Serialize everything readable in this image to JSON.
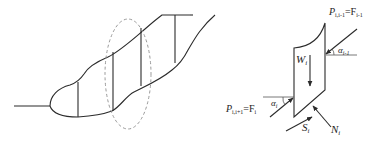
{
  "figure": {
    "left_panel": {
      "description": "Slope cross-section divided into vertical slices, one slice highlighted by dashed ellipse"
    },
    "right_panel": {
      "description": "Free-body diagram of slice i",
      "labels": {
        "P_left": {
          "base": "P",
          "sub": "i,i+1",
          "eq": "=F",
          "eq_sub": "i"
        },
        "P_right": {
          "base": "P",
          "sub": "i,i-1",
          "eq": "=F",
          "eq_sub": "i-1"
        },
        "weight": {
          "base": "W",
          "sub": "i"
        },
        "alpha_left": {
          "base": "α",
          "sub": "i"
        },
        "alpha_right": {
          "base": "α",
          "sub": "i-1"
        },
        "shear": {
          "base": "S",
          "sub": "i"
        },
        "normal": {
          "base": "N",
          "sub": "i"
        }
      }
    },
    "colors": {
      "stroke": "#2b2b2b",
      "dashed_ellipse": "#9a9a9a",
      "background": "#ffffff"
    }
  }
}
